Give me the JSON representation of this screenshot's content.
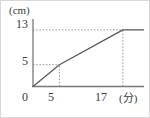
{
  "chart_data": {
    "type": "line",
    "title": "",
    "subtitle": "",
    "xlabel": "(分)",
    "ylabel": "(cm)",
    "xlim": [
      0,
      21
    ],
    "ylim": [
      0,
      15.5
    ],
    "xticks": [
      0,
      5,
      17
    ],
    "xtick_labels": [
      "0",
      "5",
      "17"
    ],
    "yticks": [
      5,
      13
    ],
    "ytick_labels": [
      "5",
      "13"
    ],
    "grid": false,
    "legend": null,
    "guide_lines": [
      {
        "name": "horizontal-guide-5",
        "orientation": "horizontal",
        "value": 5,
        "style": "dotted",
        "from_x": 0,
        "to_x": 5
      },
      {
        "name": "horizontal-guide-13",
        "orientation": "horizontal",
        "value": 13,
        "style": "dotted",
        "from_x": 0,
        "to_x": 17
      },
      {
        "name": "vertical-guide-5",
        "orientation": "vertical",
        "value": 5,
        "style": "dotted",
        "from_y": 0,
        "to_y": 5
      },
      {
        "name": "vertical-guide-17",
        "orientation": "vertical",
        "value": 17,
        "style": "dotted",
        "from_y": 0,
        "to_y": 13
      }
    ],
    "series": [
      {
        "name": "water-level",
        "style": "solid",
        "color": "#555555",
        "points": [
          {
            "x": 0,
            "y": 0
          },
          {
            "x": 5,
            "y": 5
          },
          {
            "x": 17,
            "y": 13
          },
          {
            "x": 21,
            "y": 13
          }
        ]
      }
    ]
  },
  "labels": {
    "y_unit": "(cm)",
    "x_unit": "(分)",
    "y_tick_13": "13",
    "y_tick_5": "5",
    "x_tick_0": "0",
    "x_tick_5": "5",
    "x_tick_17": "17"
  },
  "colors": {
    "axis": "#777777",
    "line": "#555555",
    "guide": "#999999",
    "text": "#3a3a3a",
    "background": "#ffffff",
    "border": "#d8d8d8"
  }
}
